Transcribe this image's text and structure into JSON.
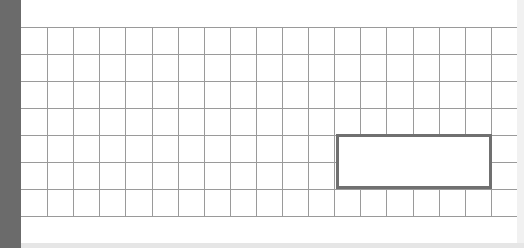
{
  "colors": {
    "left_bar": "#6b6b6b",
    "page_bg": "#ffffff",
    "grid_line": "#9a9a9a",
    "selection_border": "#707070"
  },
  "grid": {
    "top": 27,
    "row_height": 27,
    "rows": 7,
    "col_width": 26.1,
    "cols": 19
  },
  "selection": {
    "label": "",
    "x": 315,
    "y": 134,
    "width": 156,
    "height": 55
  }
}
